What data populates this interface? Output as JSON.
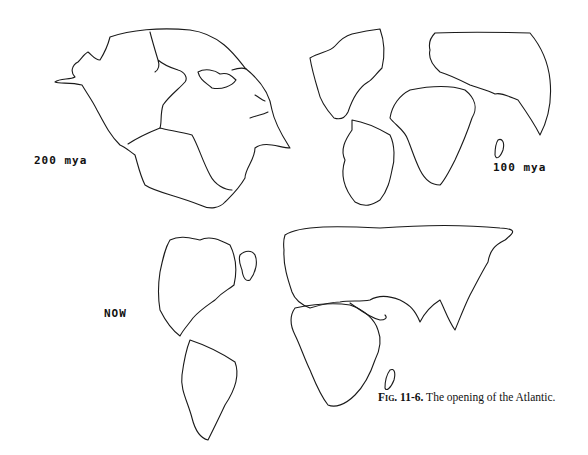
{
  "figure": {
    "caption_prefix": "Fig. 11-6.",
    "caption_text": " The opening of the Atlantic."
  },
  "panels": [
    {
      "id": "pangaea",
      "label": "200 mya",
      "description": "Supercontinent Pangaea outline with continental boundaries"
    },
    {
      "id": "cretaceous",
      "label": "100 mya",
      "description": "Continents separating, early Atlantic opening"
    },
    {
      "id": "present",
      "label": "NOW",
      "description": "Present-day world map with Atlantic Ocean"
    }
  ]
}
